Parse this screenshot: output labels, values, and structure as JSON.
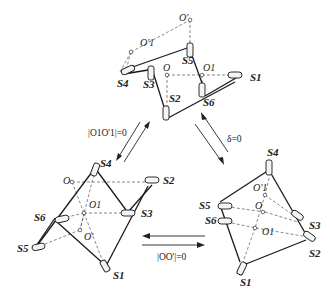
{
  "diagram": {
    "type": "parallel-mechanism-configurations",
    "configurations": [
      {
        "id": "top",
        "joints": [
          "S1",
          "S2",
          "S3",
          "S4",
          "S5",
          "S6"
        ],
        "points": [
          "O",
          "O1",
          "O'",
          "O'1"
        ]
      },
      {
        "id": "bottom-left",
        "joints": [
          "S1",
          "S2",
          "S3",
          "S4",
          "S5",
          "S6"
        ],
        "points": [
          "O",
          "O1",
          "O'"
        ]
      },
      {
        "id": "bottom-right",
        "joints": [
          "S1",
          "S2",
          "S3",
          "S4",
          "S5",
          "S6"
        ],
        "points": [
          "O",
          "O1",
          "O'1"
        ]
      }
    ],
    "transitions": [
      {
        "from": "top",
        "to": "bottom-left",
        "condition": "|O1O'1|=0"
      },
      {
        "from": "top",
        "to": "bottom-right",
        "condition": "δ=0"
      },
      {
        "from": "bottom-right",
        "to": "bottom-left",
        "condition": "|OO'|=0"
      }
    ]
  },
  "labels": {
    "top": {
      "S1": "S1",
      "S2": "S2",
      "S3": "S3",
      "S4": "S4",
      "S5": "S5",
      "S6": "S6",
      "O": "O",
      "O1": "O1",
      "Op": "O'",
      "O1p": "O'1"
    },
    "left": {
      "S1": "S1",
      "S2": "S2",
      "S3": "S3",
      "S4": "S4",
      "S5": "S5",
      "S6": "S6",
      "O": "O",
      "O1": "O1",
      "Op": "O'"
    },
    "right": {
      "S1": "S1",
      "S2": "S2",
      "S3": "S3",
      "S4": "S4",
      "S5": "S5",
      "S6": "S6",
      "O": "O",
      "O1": "O1",
      "O1p": "O'1"
    },
    "cond_left": "|O1O'1|=0",
    "cond_right": "δ=0",
    "cond_bottom": "|OO'|=0"
  }
}
